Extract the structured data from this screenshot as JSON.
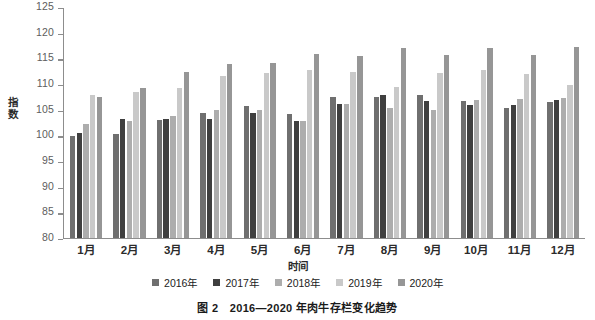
{
  "caption": "图 2　2016—2020 年肉牛存栏变化趋势",
  "axes": {
    "ylabel": "指数",
    "xlabel": "时间",
    "yticks": [
      125,
      120,
      115,
      110,
      105,
      100,
      95,
      90,
      85,
      80
    ]
  },
  "legend": [
    {
      "label": "2016年",
      "color": "#6f6f6f"
    },
    {
      "label": "2017年",
      "color": "#3f3f3f"
    },
    {
      "label": "2018年",
      "color": "#adadad"
    },
    {
      "label": "2019年",
      "color": "#c9c9c9"
    },
    {
      "label": "2020年",
      "color": "#969696"
    }
  ],
  "chart_data": {
    "type": "bar",
    "title": "图 2　2016—2020 年肉牛存栏变化趋势",
    "xlabel": "时间",
    "ylabel": "指数",
    "ylim": [
      80,
      125
    ],
    "ytick_step": 5,
    "grid": false,
    "legend_position": "bottom",
    "categories": [
      "1月",
      "2月",
      "3月",
      "4月",
      "5月",
      "6月",
      "7月",
      "8月",
      "9月",
      "10月",
      "11月",
      "12月"
    ],
    "series": [
      {
        "name": "2016年",
        "color": "#6f6f6f",
        "values": [
          100.0,
          100.4,
          103.0,
          104.5,
          105.8,
          104.2,
          107.6,
          107.6,
          108.0,
          106.8,
          105.4,
          106.6
        ]
      },
      {
        "name": "2017年",
        "color": "#3f3f3f",
        "values": [
          100.5,
          103.2,
          103.3,
          103.2,
          104.4,
          102.8,
          106.2,
          108.0,
          106.7,
          106.0,
          106.0,
          107.0
        ]
      },
      {
        "name": "2018年",
        "color": "#adadad",
        "values": [
          102.3,
          102.9,
          103.8,
          105.0,
          105.0,
          102.9,
          106.2,
          105.4,
          105.1,
          107.0,
          107.2,
          107.4
        ]
      },
      {
        "name": "2019年",
        "color": "#c9c9c9",
        "values": [
          108.0,
          108.5,
          109.3,
          111.7,
          112.2,
          112.8,
          112.5,
          109.6,
          112.2,
          112.9,
          112.0,
          110.0
        ]
      },
      {
        "name": "2020年",
        "color": "#969696",
        "values": [
          107.6,
          109.4,
          112.5,
          114.0,
          114.3,
          116.0,
          115.6,
          117.2,
          115.8,
          117.1,
          115.7,
          117.3
        ]
      }
    ]
  }
}
